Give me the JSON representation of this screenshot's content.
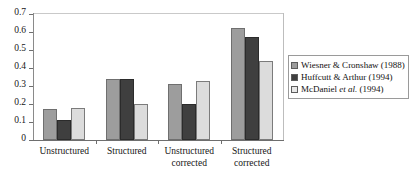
{
  "chart_data": {
    "type": "bar",
    "title": "",
    "subtitle": "",
    "xlabel": "",
    "ylabel": "",
    "ylim": [
      0,
      0.7
    ],
    "ytick_labels": [
      "0.7",
      "0.6",
      "0.5",
      "0.4",
      "0.3",
      "0.2",
      "0.1",
      "0"
    ],
    "ytick_values": [
      0.7,
      0.6,
      0.5,
      0.4,
      0.3,
      0.2,
      0.1,
      0
    ],
    "grid": false,
    "legend_position": "right",
    "categories": [
      "Unstructured",
      "Structured",
      "Unstructured\ncorrected",
      "Structured\ncorrected"
    ],
    "series": [
      {
        "name": "Wiesner & Cronshaw (1988)",
        "color": "#9d9d9d",
        "values": [
          0.17,
          0.34,
          0.31,
          0.62
        ]
      },
      {
        "name": "Huffcutt & Arthur (1994)",
        "color": "#3f3f3f",
        "values": [
          0.11,
          0.34,
          0.2,
          0.57
        ]
      },
      {
        "name": "McDaniel et al. (1994)",
        "color": "#dcdcdc",
        "values": [
          0.18,
          0.2,
          0.33,
          0.44
        ]
      }
    ]
  },
  "legend": {
    "entries": [
      {
        "label_plain": "Wiesner & Cronshaw (1988)",
        "pre": "Wiesner & Cronshaw (1988)",
        "italic": "",
        "post": ""
      },
      {
        "label_plain": "Huffcutt & Arthur (1994)",
        "pre": "Huffcutt & Arthur (1994)",
        "italic": "",
        "post": ""
      },
      {
        "label_plain": "McDaniel et al. (1994)",
        "pre": "McDaniel ",
        "italic": "et al.",
        "post": " (1994)"
      }
    ]
  }
}
